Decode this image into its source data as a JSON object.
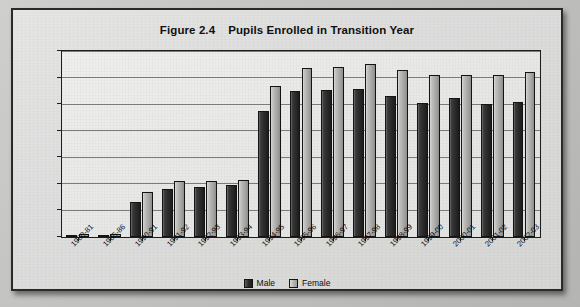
{
  "figure": {
    "number": "Figure 2.4",
    "title": "Pupils Enrolled in Transition Year"
  },
  "legend": {
    "male_label": "Male",
    "female_label": "Female",
    "male_color": "#2b2b2b",
    "female_color": "#b5b5b3",
    "position": "bottom-center"
  },
  "axis": {
    "y_ticks": [
      "0",
      "2,000",
      "4,000",
      "6,000",
      "8,000",
      "10,000",
      "12,000",
      "14,000"
    ]
  },
  "chart_data": {
    "type": "bar",
    "xlabel": "",
    "ylabel": "",
    "ylim": [
      0,
      14000
    ],
    "ytick_step": 2000,
    "grid": true,
    "legend_position": "bottom-center",
    "categories": [
      "1980-81",
      "1985-86",
      "1990-91",
      "1991-92",
      "1992-93",
      "1993-94",
      "1994-95",
      "1995-96",
      "1996-97",
      "1997-98",
      "1998-99",
      "1999-00",
      "2000-01",
      "2001-02",
      "2002-03"
    ],
    "series": [
      {
        "name": "Male",
        "color": "#2b2b2b",
        "values": [
          150,
          140,
          2600,
          3650,
          3750,
          3950,
          9500,
          11000,
          11050,
          11150,
          10600,
          10050,
          10450,
          10000,
          10150
        ]
      },
      {
        "name": "Female",
        "color": "#b5b5b3",
        "values": [
          220,
          200,
          3400,
          4250,
          4250,
          4300,
          11400,
          12700,
          12800,
          13050,
          12550,
          12200,
          12200,
          12200,
          12450
        ]
      }
    ]
  }
}
